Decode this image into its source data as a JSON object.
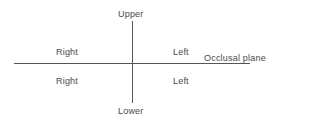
{
  "diagram": {
    "axis_labels": {
      "top": "Upper",
      "bottom": "Lower",
      "horizontal_line": "Occlusal plane"
    },
    "quadrants": {
      "upper_right": "Right",
      "lower_right": "Right",
      "upper_left": "Left",
      "lower_left": "Left"
    },
    "colors": {
      "line": "#555555",
      "text": "#4a4a4a",
      "background": "#ffffff"
    }
  }
}
